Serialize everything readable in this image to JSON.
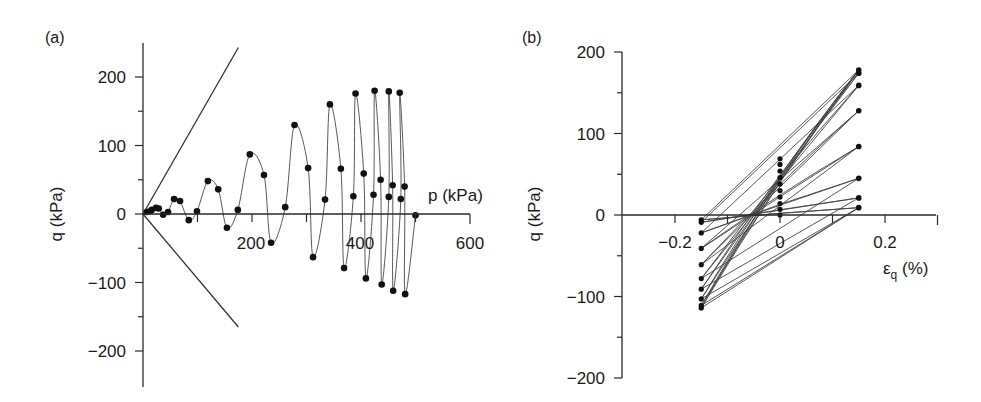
{
  "chart_data": [
    {
      "panel": "(a)",
      "type": "line",
      "xlabel": "p (kPa)",
      "ylabel": "q (kPa)",
      "xlim": [
        0,
        600
      ],
      "ylim": [
        -250,
        250
      ],
      "x_ticks": [
        200,
        400,
        600
      ],
      "x_minor_ticks": [
        100,
        300,
        500
      ],
      "y_ticks": [
        -200,
        -100,
        0,
        100,
        200
      ],
      "y_minor_ticks": [
        -150,
        -50,
        50,
        150
      ],
      "grid": false,
      "envelope_lines": [
        {
          "name": "compression",
          "from": [
            0,
            0
          ],
          "to": [
            175,
            243
          ]
        },
        {
          "name": "extension",
          "from": [
            0,
            0
          ],
          "to": [
            175,
            -165
          ]
        }
      ],
      "series": [
        {
          "name": "stress path",
          "points": [
            [
              7,
              3
            ],
            [
              13,
              4
            ],
            [
              16,
              6
            ],
            [
              24,
              9
            ],
            [
              29,
              8
            ],
            [
              37,
              -1
            ],
            [
              46,
              3
            ],
            [
              57,
              22
            ],
            [
              68,
              19
            ],
            [
              84,
              -9
            ],
            [
              99,
              4
            ],
            [
              119,
              48
            ],
            [
              138,
              36
            ],
            [
              154,
              -20
            ],
            [
              174,
              6
            ],
            [
              196,
              87
            ],
            [
              222,
              57
            ],
            [
              235,
              -42
            ],
            [
              261,
              10
            ],
            [
              278,
              130
            ],
            [
              303,
              67
            ],
            [
              312,
              -63
            ],
            [
              334,
              21
            ],
            [
              343,
              160
            ],
            [
              363,
              66
            ],
            [
              369,
              -79
            ],
            [
              386,
              26
            ],
            [
              390,
              176
            ],
            [
              405,
              59
            ],
            [
              409,
              -94
            ],
            [
              423,
              28
            ],
            [
              425,
              180
            ],
            [
              436,
              50
            ],
            [
              438,
              -103
            ],
            [
              451,
              25
            ],
            [
              451,
              179
            ],
            [
              458,
              42
            ],
            [
              459,
              -112
            ],
            [
              473,
              22
            ],
            [
              471,
              177
            ],
            [
              480,
              40
            ],
            [
              481,
              -117
            ],
            [
              500,
              -2
            ]
          ]
        }
      ]
    },
    {
      "panel": "(b)",
      "type": "line",
      "xlabel": "εq (%)",
      "ylabel": "q (kPa)",
      "xlim": [
        -0.3,
        0.3
      ],
      "ylim": [
        -200,
        200
      ],
      "x_ticks": [
        -0.2,
        0,
        0.2
      ],
      "x_minor_ticks": [
        -0.1,
        0.1,
        0.3
      ],
      "y_ticks": [
        -200,
        -100,
        0,
        100,
        200
      ],
      "y_minor_ticks": [
        -150,
        -50,
        50,
        150
      ],
      "grid": false,
      "columns": {
        "left": {
          "x": -0.15,
          "q": [
            -6,
            -9,
            -22,
            -41,
            -61,
            -78,
            -91,
            -103,
            -111,
            -114
          ]
        },
        "middle": {
          "x": 0,
          "q": [
            0,
            7,
            14,
            22,
            30,
            38,
            46,
            54,
            62,
            69
          ]
        },
        "right": {
          "x": 0.15,
          "q": [
            9,
            21,
            45,
            84,
            128,
            159,
            174,
            178
          ]
        }
      },
      "series": [
        {
          "name": "loading branches (-0.15 → 0.15)",
          "pairs": [
            [
              -6,
              9
            ],
            [
              -9,
              21
            ],
            [
              -22,
              45
            ],
            [
              -41,
              84
            ],
            [
              -61,
              128
            ],
            [
              -78,
              159
            ],
            [
              -91,
              174
            ],
            [
              -103,
              178
            ],
            [
              -111,
              178
            ],
            [
              -114,
              178
            ]
          ]
        },
        {
          "name": "unloading branches (0.15 → -0.15)",
          "pairs": [
            [
              9,
              -6
            ],
            [
              21,
              -9
            ],
            [
              45,
              -22
            ],
            [
              84,
              -41
            ],
            [
              128,
              -61
            ],
            [
              159,
              -78
            ],
            [
              174,
              -91
            ],
            [
              178,
              -103
            ],
            [
              178,
              -111
            ],
            [
              178,
              -114
            ]
          ]
        }
      ]
    }
  ],
  "panels": {
    "a": {
      "label": "(a)",
      "ylabel": "q (kPa)",
      "xlabel": "p (kPa)",
      "yticks": [
        "200",
        "100",
        "0",
        "−100",
        "−200"
      ],
      "xticks": [
        "200",
        "400",
        "600"
      ]
    },
    "b": {
      "label": "(b)",
      "ylabel": "q (kPa)",
      "xlabel_main": "ε",
      "xlabel_sub": "q",
      "xlabel_unit": " (%)",
      "yticks": [
        "200",
        "100",
        "0",
        "−100",
        "−200"
      ],
      "xticks": [
        "−0.2",
        "0",
        "0.2"
      ]
    }
  }
}
